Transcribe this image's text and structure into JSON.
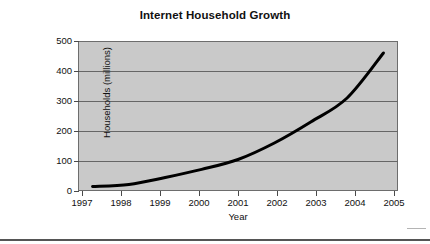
{
  "chart_data": {
    "type": "line",
    "title": "Internet Household Growth",
    "xlabel": "Year",
    "ylabel": "Households (millions)",
    "x": [
      1997,
      1998,
      1999,
      2000,
      2001,
      2002,
      2003,
      2004,
      2005
    ],
    "categories": [
      "1997",
      "1998",
      "1999",
      "2000",
      "2001",
      "2002",
      "2003",
      "2004",
      "2005"
    ],
    "values": [
      15,
      22,
      45,
      72,
      105,
      160,
      230,
      310,
      460
    ],
    "series": [
      {
        "name": "Households (millions)",
        "values": [
          15,
          22,
          45,
          72,
          105,
          160,
          230,
          310,
          460
        ]
      }
    ],
    "ylim": [
      0,
      500
    ],
    "xlim": [
      1996.6,
      2005.4
    ],
    "y_ticks": [
      0,
      100,
      200,
      300,
      400,
      500
    ],
    "y_tick_labels": [
      "0",
      "100",
      "200",
      "300",
      "400",
      "500"
    ],
    "x_ticks": [
      1997,
      1998,
      1999,
      2000,
      2001,
      2002,
      2003,
      2004,
      2005
    ],
    "grid": "horizontal",
    "legend": "none",
    "plot_background_color": "#c9c9c9",
    "line_color": "#000000",
    "gridline_color": "#666666",
    "frame_color": "#6d6d6d",
    "page_background_color": "#ffffff"
  }
}
